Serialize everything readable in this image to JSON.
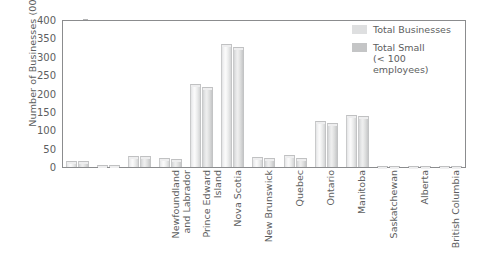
{
  "chart_data": {
    "type": "bar",
    "title": "",
    "xlabel": "",
    "ylabel": "Number of Businesses (000s)",
    "ylim": [
      0,
      400
    ],
    "ytick_step": 50,
    "ytick_labels": [
      "400",
      "350",
      "300",
      "250",
      "200",
      "150",
      "100",
      "50",
      "0"
    ],
    "grid": false,
    "legend_position": "top-right",
    "categories": [
      "Newfoundland\nand Labrador",
      "Prince Edward\nIsland",
      "Nova Scotia",
      "New Brunswick",
      "Quebec",
      "Ontario",
      "Manitoba",
      "Saskatchewan",
      "Alberta",
      "British Columbia",
      "Yukon Territory",
      "Northwest\nTerritories",
      "Nunavut"
    ],
    "series": [
      {
        "name": "Total Businesses",
        "color": "#e9eaea",
        "values": [
          17,
          5,
          31,
          25,
          226,
          336,
          27,
          33,
          126,
          142,
          3,
          2,
          1
        ]
      },
      {
        "name": "Total Small\n(< 100 employees)",
        "color": "#d5d6d7",
        "values": [
          16,
          5,
          30,
          23,
          219,
          327,
          25,
          25,
          121,
          138,
          3,
          2,
          1
        ]
      }
    ]
  },
  "legend": {
    "items": [
      {
        "label": "Total Businesses",
        "swatch": "total-businesses-swatch"
      },
      {
        "label": "Total Small\n(< 100 employees)",
        "swatch": "total-small-swatch"
      }
    ]
  },
  "axes": {
    "y_title": "Number of Businesses (000s)"
  }
}
